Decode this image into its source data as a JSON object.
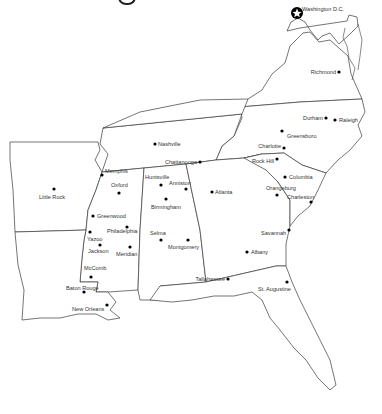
{
  "map": {
    "region": "Southeastern United States",
    "capital_marker": {
      "label": "Washington D.C.",
      "icon": "star-in-circle-icon",
      "x": 297,
      "y": 13
    },
    "cities": [
      {
        "name": "Washington D.C.",
        "x": 297,
        "y": 13,
        "lx": 302,
        "ly": 11,
        "anchor": "start"
      },
      {
        "name": "Richmond",
        "x": 339,
        "y": 72,
        "lx": 336,
        "ly": 74,
        "anchor": "end"
      },
      {
        "name": "Durham",
        "x": 326,
        "y": 118,
        "lx": 323,
        "ly": 120,
        "anchor": "end"
      },
      {
        "name": "Raleigh",
        "x": 335,
        "y": 120,
        "lx": 339,
        "ly": 122,
        "anchor": "start"
      },
      {
        "name": "Greensboro",
        "x": 282,
        "y": 131,
        "lx": 287,
        "ly": 138,
        "anchor": "start"
      },
      {
        "name": "Charlotte",
        "x": 284,
        "y": 148,
        "lx": 281,
        "ly": 148,
        "anchor": "end"
      },
      {
        "name": "Rock Hill",
        "x": 277,
        "y": 159,
        "lx": 274,
        "ly": 163,
        "anchor": "end"
      },
      {
        "name": "Columbia",
        "x": 285,
        "y": 177,
        "lx": 289,
        "ly": 179,
        "anchor": "start"
      },
      {
        "name": "Orangeburg",
        "x": 277,
        "y": 195,
        "lx": 266,
        "ly": 190,
        "anchor": "start"
      },
      {
        "name": "Charleston",
        "x": 311,
        "y": 202,
        "lx": 287,
        "ly": 199,
        "anchor": "start"
      },
      {
        "name": "Savannah",
        "x": 289,
        "y": 230,
        "lx": 261,
        "ly": 235,
        "anchor": "start"
      },
      {
        "name": "Atlanta",
        "x": 212,
        "y": 192,
        "lx": 215,
        "ly": 194,
        "anchor": "start"
      },
      {
        "name": "Albany",
        "x": 247,
        "y": 252,
        "lx": 251,
        "ly": 254,
        "anchor": "start"
      },
      {
        "name": "Tallahassee",
        "x": 228,
        "y": 279,
        "lx": 225,
        "ly": 281,
        "anchor": "end"
      },
      {
        "name": "St. Augustine",
        "x": 287,
        "y": 282,
        "lx": 258,
        "ly": 291,
        "anchor": "start"
      },
      {
        "name": "Nashville",
        "x": 155,
        "y": 144,
        "lx": 158,
        "ly": 146,
        "anchor": "start"
      },
      {
        "name": "Chattanooga",
        "x": 200,
        "y": 162,
        "lx": 197,
        "ly": 164,
        "anchor": "end"
      },
      {
        "name": "Memphis",
        "x": 102,
        "y": 175,
        "lx": 105,
        "ly": 173,
        "anchor": "start"
      },
      {
        "name": "Little Rock",
        "x": 54,
        "y": 189,
        "lx": 39,
        "ly": 199,
        "anchor": "start"
      },
      {
        "name": "Oxford",
        "x": 119,
        "y": 193,
        "lx": 111,
        "ly": 187,
        "anchor": "start"
      },
      {
        "name": "Greenwood",
        "x": 93,
        "y": 216,
        "lx": 97,
        "ly": 218,
        "anchor": "start"
      },
      {
        "name": "Philadelphia",
        "x": 127,
        "y": 227,
        "lx": 107,
        "ly": 233,
        "anchor": "start"
      },
      {
        "name": "Yazoo",
        "x": 90,
        "y": 232,
        "lx": 87,
        "ly": 241,
        "anchor": "start"
      },
      {
        "name": "Jackson",
        "x": 100,
        "y": 245,
        "lx": 88,
        "ly": 253,
        "anchor": "start"
      },
      {
        "name": "Meridian",
        "x": 130,
        "y": 247,
        "lx": 116,
        "ly": 256,
        "anchor": "start"
      },
      {
        "name": "McComb",
        "x": 91,
        "y": 277,
        "lx": 84,
        "ly": 270,
        "anchor": "start"
      },
      {
        "name": "Baton Rouge",
        "x": 84,
        "y": 292,
        "lx": 66,
        "ly": 290,
        "anchor": "start"
      },
      {
        "name": "New Orleans",
        "x": 107,
        "y": 305,
        "lx": 72,
        "ly": 311,
        "anchor": "start"
      },
      {
        "name": "Huntsville",
        "x": 161,
        "y": 185,
        "lx": 145,
        "ly": 179,
        "anchor": "start"
      },
      {
        "name": "Anniston",
        "x": 186,
        "y": 189,
        "lx": 169,
        "ly": 185,
        "anchor": "start"
      },
      {
        "name": "Birmingham",
        "x": 166,
        "y": 199,
        "lx": 151,
        "ly": 209,
        "anchor": "start"
      },
      {
        "name": "Selma",
        "x": 161,
        "y": 240,
        "lx": 150,
        "ly": 235,
        "anchor": "start"
      },
      {
        "name": "Montgomery",
        "x": 188,
        "y": 240,
        "lx": 168,
        "ly": 249,
        "anchor": "start"
      }
    ]
  }
}
